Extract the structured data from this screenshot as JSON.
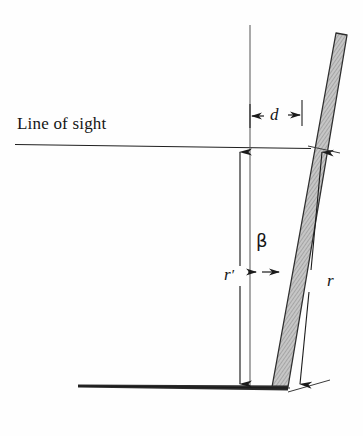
{
  "figure": {
    "type": "technical-line-diagram",
    "background_color": "#fefefe",
    "ink_color": "#151515",
    "bar_fill_color": "#b9b9b9",
    "bar_edge_color": "#2a2a2a",
    "labels": {
      "line_of_sight": "Line of sight",
      "offset_d": "d",
      "angle_beta": "β",
      "radius_r_prime": "r",
      "radius_r_prime_mark": "′",
      "radius_r": "r"
    },
    "elements": {
      "horizontal_sight_line": "line-of-sight-ray",
      "vertical_reference_line": "plumb-reference-line",
      "tilted_bar": "hatched-tilted-rod",
      "ground_line": "ground-surface-wedge",
      "dimension_d": "horizontal-offset-dimension",
      "dimension_r_prime": "vertical-distance-dimension",
      "dimension_r": "slant-distance-dimension",
      "angle_marker_beta": "tilt-angle-arrow"
    }
  }
}
